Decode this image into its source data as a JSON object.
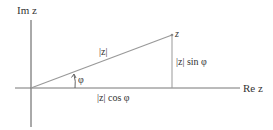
{
  "diagram": {
    "type": "complex-plane-polar-form",
    "axes": {
      "imaginary_label": "Im z",
      "real_label": "Re z"
    },
    "point": {
      "label": "z"
    },
    "segments": {
      "hypotenuse_label": "|z|",
      "vertical_label": "|z| sin φ",
      "horizontal_label": "|z| cos φ"
    },
    "angle": {
      "label": "φ"
    },
    "colors": {
      "axis": "#555555",
      "vector": "#999999",
      "text": "#333333"
    }
  }
}
